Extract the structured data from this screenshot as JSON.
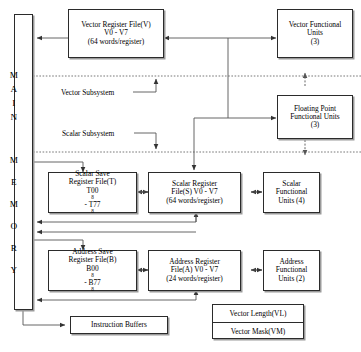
{
  "diagram": {
    "memory": {
      "label": "MAIN MEMORY",
      "letters": [
        "M",
        "A",
        "I",
        "N",
        "M",
        "E",
        "M",
        "O",
        "R",
        "Y"
      ]
    },
    "boxes": {
      "vector_register_file": {
        "line1": "Vector Register File(V)",
        "line2": "V0 - V7",
        "line3": "(64 words/register)"
      },
      "vector_functional_units": {
        "line1": "Vector Functional",
        "line2": "Units",
        "line3": "(3)"
      },
      "floating_point_units": {
        "line1": "Floating Point",
        "line2": "Functional Units",
        "line3": "(3)"
      },
      "scalar_save_register_file": {
        "line1": "Scalar Save",
        "line2": "Register File(T)",
        "line3_pre": "T00",
        "line3_sub1": "8",
        "line3_mid": " - T77",
        "line3_sub2": "8"
      },
      "scalar_register_file": {
        "line1": "Scalar Register",
        "line2": "File(S) V0 - V7",
        "line3": "(64 words/register)"
      },
      "scalar_functional_units": {
        "line1": "Scalar",
        "line2": "Functional",
        "line3": "Units (4)"
      },
      "address_save_register_file": {
        "line1": "Address Save",
        "line2": "Register File(B)",
        "line3_pre": "B00",
        "line3_sub1": "8",
        "line3_mid": " - B77",
        "line3_sub2": "8"
      },
      "address_register_file": {
        "line1": "Address Register",
        "line2": "File(A) V0 - V7",
        "line3": "(24 words/register)"
      },
      "address_functional_units": {
        "line1": "Address",
        "line2": "Functional",
        "line3": "Units (2)"
      },
      "instruction_buffers": {
        "line1": "Instruction Buffers"
      },
      "vector_length": {
        "label": "Vector Length(VL)"
      },
      "vector_mask": {
        "label": "Vector Mask(VM)"
      }
    },
    "labels": {
      "vector_subsystem": "Vector Subsystem",
      "scalar_subsystem": "Scalar Subsystem"
    },
    "colors": {
      "line": "#555555",
      "border": "#2b2b2b",
      "shadow": "#9a9a9a",
      "background": "#ffffff"
    }
  }
}
